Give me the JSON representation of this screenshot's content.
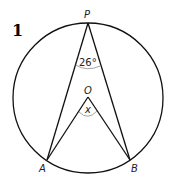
{
  "problem_number": "1",
  "points": {
    "P": "P",
    "O": "O",
    "A": "A",
    "B": "B"
  },
  "angles": {
    "inscribed": "26°",
    "central": "x"
  }
}
